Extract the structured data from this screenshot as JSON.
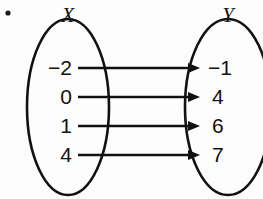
{
  "diagram": {
    "type": "mapping-diagram",
    "bullet": "•",
    "sets": [
      {
        "id": "X",
        "label": "X",
        "side": "left"
      },
      {
        "id": "Y",
        "label": "Y",
        "side": "right"
      }
    ],
    "domain_label": "X",
    "range_label": "Y",
    "domain_values": [
      "−2",
      "0",
      "1",
      "4"
    ],
    "range_values": [
      "−1",
      "4",
      "6",
      "7"
    ],
    "pairs": [
      {
        "from": "−2",
        "to": "−1"
      },
      {
        "from": "0",
        "to": "4"
      },
      {
        "from": "1",
        "to": "6"
      },
      {
        "from": "4",
        "to": "7"
      }
    ],
    "colors": {
      "stroke": "#111111",
      "background": "#fdfdfd",
      "text": "#111111"
    }
  }
}
